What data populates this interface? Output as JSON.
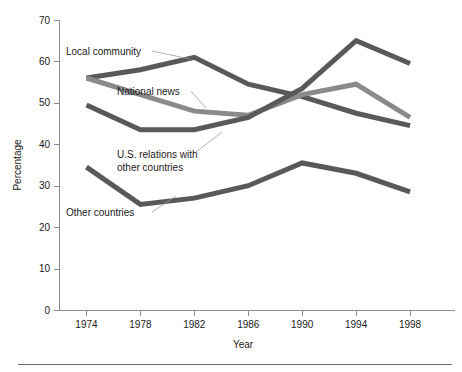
{
  "chart_data": {
    "type": "line",
    "title": "",
    "xlabel": "Year",
    "ylabel": "Percentage",
    "x": [
      1974,
      1978,
      1982,
      1986,
      1990,
      1994,
      1998
    ],
    "categories": [
      "1974",
      "1978",
      "1982",
      "1986",
      "1990",
      "1994",
      "1998"
    ],
    "xlim": [
      1972,
      2000
    ],
    "ylim": [
      0,
      70
    ],
    "yticks": [
      0,
      10,
      20,
      30,
      40,
      50,
      60,
      70
    ],
    "ytick_labels": [
      "0",
      "10",
      "20",
      "30",
      "40",
      "50",
      "60",
      "70"
    ],
    "xticks": [
      1974,
      1978,
      1982,
      1986,
      1990,
      1994,
      1998
    ],
    "xtick_labels": [
      "1974",
      "1978",
      "1982",
      "1986",
      "1990",
      "1994",
      "1998"
    ],
    "grid": false,
    "legend_position": "inline-annotations",
    "series": [
      {
        "name": "Local community",
        "color": "#595959",
        "values": [
          56.0,
          58.0,
          61.0,
          54.5,
          51.5,
          47.5,
          44.5
        ]
      },
      {
        "name": "National news",
        "color": "#8a8a8a",
        "values": [
          56.0,
          52.0,
          48.0,
          47.0,
          52.0,
          54.5,
          46.5
        ]
      },
      {
        "name": "U.S. relations with other countries",
        "color": "#595959",
        "values": [
          49.5,
          43.5,
          43.5,
          46.5,
          53.5,
          65.0,
          59.5
        ]
      },
      {
        "name": "Other countries",
        "color": "#595959",
        "values": [
          34.5,
          25.5,
          27.0,
          30.0,
          35.5,
          33.0,
          28.5
        ]
      }
    ],
    "annotations": [
      {
        "text": "Local community",
        "text_x": 66,
        "text_y": 55,
        "leader_from_x": 152,
        "leader_from_y": 51,
        "leader_to_x": 190,
        "leader_to_y": 59
      },
      {
        "text": "National news",
        "text_x": 117,
        "text_y": 95,
        "leader_from_x": 191,
        "leader_from_y": 91,
        "leader_to_x": 206,
        "leader_to_y": 108
      },
      {
        "text": "U.S. relations with",
        "text_x": 117,
        "text_y": 158,
        "leader_from_x": 0,
        "leader_from_y": 0,
        "leader_to_x": 0,
        "leader_to_y": 0
      },
      {
        "text": "other countries",
        "text_x": 117,
        "text_y": 171,
        "leader_from_x": 196,
        "leader_from_y": 152,
        "leader_to_x": 222,
        "leader_to_y": 132
      },
      {
        "text": "Other countries",
        "text_x": 66,
        "text_y": 216,
        "leader_from_x": 152,
        "leader_from_y": 212,
        "leader_to_x": 176,
        "leader_to_y": 196
      }
    ]
  },
  "colors": {
    "axis": "#8c8c8c",
    "text": "#1a1a1a",
    "series_dark": "#595959",
    "series_light": "#8a8a8a",
    "footer_rule": "#6e6e6e",
    "background": "#ffffff"
  }
}
